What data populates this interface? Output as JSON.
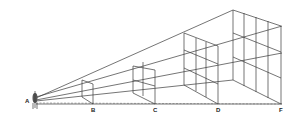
{
  "diagram": {
    "labels": {
      "eye": "A",
      "b": "B",
      "c": "C",
      "d": "D",
      "f": "F"
    },
    "colors": {
      "line": "#3a3a3a",
      "background": "#ffffff"
    }
  }
}
